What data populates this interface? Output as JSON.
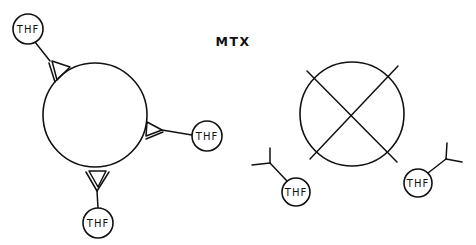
{
  "title": "MTX",
  "colors": {
    "ink": "#111111",
    "background": "#ffffff"
  },
  "left_panel": {
    "description": "Carrier sphere with three receptor sites each bound to a THF group",
    "carrier_label": "",
    "bound_groups": [
      {
        "label": "THF",
        "position": "upper-left"
      },
      {
        "label": "THF",
        "position": "right"
      },
      {
        "label": "THF",
        "position": "bottom"
      }
    ]
  },
  "right_panel": {
    "description": "Blocked carrier (crossed circle) with two free THF groups",
    "blocked_symbol": "cross-circle",
    "free_groups": [
      {
        "label": "THF",
        "position": "lower-left"
      },
      {
        "label": "THF",
        "position": "lower-right"
      }
    ]
  }
}
